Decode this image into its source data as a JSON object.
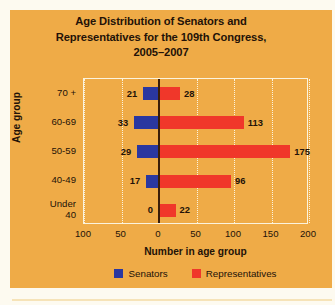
{
  "colors": {
    "background": "#efab47",
    "page": "#fdfaf0",
    "senators": "#2a37a0",
    "representatives": "#f0372a",
    "text": "#231208",
    "grid": "#fbf3dd",
    "zero_line": "#3a1d08"
  },
  "title": {
    "line1": "Age Distribution of Senators and",
    "line2": "Representatives for the 109th Congress,",
    "line3": "2005–2007"
  },
  "chart_data": {
    "type": "bar",
    "orientation": "horizontal",
    "style": "diverging-bidirectional",
    "title": "Age Distribution of Senators and Representatives for the 109th Congress, 2005–2007",
    "xlabel": "Number in age group",
    "ylabel": "Age group",
    "categories": [
      "70 +",
      "60-69",
      "50-59",
      "40-49",
      "Under 40"
    ],
    "category_lines": [
      [
        "70 +"
      ],
      [
        "60-69"
      ],
      [
        "50-59"
      ],
      [
        "40-49"
      ],
      [
        "Under",
        "40"
      ]
    ],
    "series": [
      {
        "name": "Senators",
        "color": "#2a37a0",
        "direction": "left",
        "values": [
          21,
          33,
          29,
          17,
          0
        ]
      },
      {
        "name": "Representatives",
        "color": "#f0372a",
        "direction": "right",
        "values": [
          28,
          113,
          175,
          96,
          22
        ]
      }
    ],
    "xticks": [
      100,
      50,
      0,
      50,
      100,
      150,
      200
    ],
    "xtick_values": [
      -100,
      -50,
      0,
      50,
      100,
      150,
      200
    ],
    "xlim": [
      -100,
      200
    ],
    "grid": true,
    "grid_axis": "x",
    "legend_position": "bottom",
    "data_labels": true
  },
  "axes": {
    "x_title": "Number in age group",
    "y_title": "Age group",
    "x_ticks": [
      "100",
      "50",
      "0",
      "50",
      "100",
      "150",
      "200"
    ],
    "y_categories": [
      "70 +",
      "60-69",
      "50-59",
      "40-49",
      "Under 40"
    ]
  },
  "legend": {
    "items": [
      {
        "label": "Senators",
        "color": "#2a37a0"
      },
      {
        "label": "Representatives",
        "color": "#f0372a"
      }
    ]
  }
}
